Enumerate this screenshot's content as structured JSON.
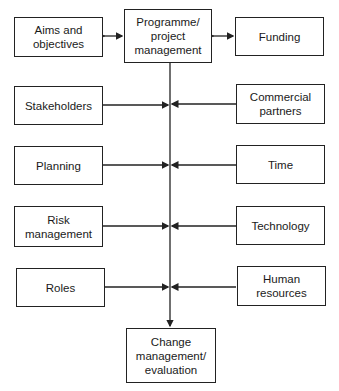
{
  "diagram": {
    "center_top": {
      "label": "Programme/ project management"
    },
    "center_bottom": {
      "label": "Change management/ evaluation"
    },
    "top_left": {
      "label": "Aims and objectives",
      "connection": "bidirectional"
    },
    "top_right": {
      "label": "Funding",
      "connection": "bidirectional"
    },
    "left_inputs": [
      {
        "label": "Stakeholders"
      },
      {
        "label": "Planning"
      },
      {
        "label": "Risk management"
      },
      {
        "label": "Roles"
      }
    ],
    "right_inputs": [
      {
        "label": "Commercial partners"
      },
      {
        "label": "Time"
      },
      {
        "label": "Technology"
      },
      {
        "label": "Human resources"
      }
    ],
    "colors": {
      "line": "#222222",
      "background": "#ffffff"
    }
  }
}
